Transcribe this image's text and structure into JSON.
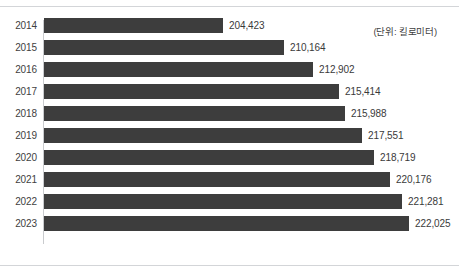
{
  "caption": {
    "unit_label": "(단위: 킬로미터)"
  },
  "chart_data": {
    "type": "bar",
    "orientation": "horizontal",
    "title": "",
    "subtitle": "",
    "xlabel": "",
    "ylabel": "",
    "unit": "킬로미터",
    "unit_label": "(단위: 킬로미터)",
    "grid": false,
    "legend": null,
    "legend_position": "none",
    "bar_color": "#3d3d3d",
    "axis_color": "#c9cbce",
    "label_color": "#3a3a3a",
    "baseline": 187500,
    "xlim": [
      187500,
      223500
    ],
    "categories": [
      "2014",
      "2015",
      "2016",
      "2017",
      "2018",
      "2019",
      "2020",
      "2021",
      "2022",
      "2023"
    ],
    "values": [
      204423,
      210164,
      212902,
      215414,
      215988,
      217551,
      218719,
      220176,
      221281,
      222025
    ],
    "value_labels": [
      "204,423",
      "210,164",
      "212,902",
      "215,414",
      "215,988",
      "217,551",
      "218,719",
      "220,176",
      "221,281",
      "222,025"
    ],
    "bars": [
      {
        "category": "2014",
        "value": 204423,
        "label": "204,423"
      },
      {
        "category": "2015",
        "value": 210164,
        "label": "210,164"
      },
      {
        "category": "2016",
        "value": 212902,
        "label": "212,902"
      },
      {
        "category": "2017",
        "value": 215414,
        "label": "215,414"
      },
      {
        "category": "2018",
        "value": 215988,
        "label": "215,988"
      },
      {
        "category": "2019",
        "value": 217551,
        "label": "217,551"
      },
      {
        "category": "2020",
        "value": 218719,
        "label": "218,719"
      },
      {
        "category": "2021",
        "value": 220176,
        "label": "220,176"
      },
      {
        "category": "2022",
        "value": 221281,
        "label": "221,281"
      },
      {
        "category": "2023",
        "value": 222025,
        "label": "222,025"
      }
    ]
  }
}
